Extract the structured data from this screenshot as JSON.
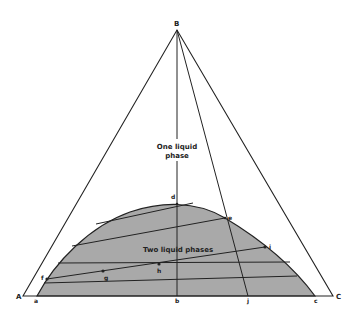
{
  "diagram": {
    "type": "ternary-phase-diagram",
    "vertices": [
      {
        "label": "A",
        "x": 23,
        "y": 296
      },
      {
        "label": "B",
        "x": 177,
        "y": 30
      },
      {
        "label": "C",
        "x": 333,
        "y": 296
      }
    ],
    "region_labels": {
      "one_phase_line1": "One liquid",
      "one_phase_line2": "phase",
      "two_phase": "Two liquid phases"
    },
    "points": {
      "a": "a",
      "b": "b",
      "c": "c",
      "d": "d",
      "e": "e",
      "f": "f",
      "g": "g",
      "h": "h",
      "i": "i",
      "j": "j",
      "A": "A",
      "B": "B",
      "C": "C"
    },
    "colors": {
      "two_phase_fill": "#a9a9a9",
      "line": "#222222",
      "background": "#ffffff"
    }
  }
}
